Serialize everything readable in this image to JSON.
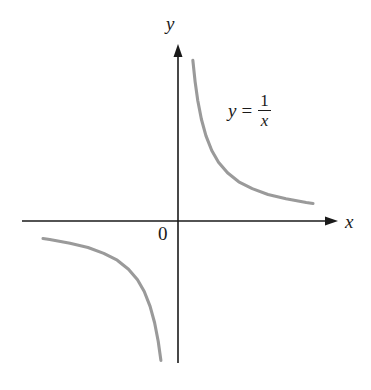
{
  "figure": {
    "background_color": "#ffffff",
    "axis_color": "#1a1a1a",
    "curve_color": "#9a9a9a",
    "origin_label": "0",
    "x_axis_label": "x",
    "y_axis_label": "y"
  },
  "equation": {
    "lhs": "y",
    "relation": "=",
    "numerator": "1",
    "denominator": "x",
    "plain": "y = 1/x"
  },
  "chart_data": {
    "type": "line",
    "title": "",
    "subtitle": "",
    "xlabel": "x",
    "ylabel": "y",
    "annotations": [
      {
        "text": "y = 1/x",
        "x": 1.55,
        "y": 2.45
      },
      {
        "text": "0",
        "x": -0.22,
        "y": -0.28
      }
    ],
    "legend": [],
    "legend_position": "none",
    "grid": false,
    "axis_arrows": true,
    "tick_labels_x": [],
    "tick_labels_y": [],
    "xlim": [
      -3.1,
      3.2
    ],
    "ylim": [
      -2.9,
      3.5
    ],
    "function": "y = 1/x",
    "series": [
      {
        "name": "y = 1/x (x > 0)",
        "color": "#9a9a9a",
        "x": [
          0.33,
          0.38,
          0.44,
          0.52,
          0.62,
          0.75,
          0.9,
          1.1,
          1.35,
          1.65,
          2.0,
          2.4,
          2.85,
          3.0
        ],
        "y": [
          3.03,
          2.63,
          2.27,
          1.92,
          1.61,
          1.33,
          1.11,
          0.91,
          0.74,
          0.61,
          0.5,
          0.42,
          0.35,
          0.33
        ]
      },
      {
        "name": "y = 1/x (x < 0)",
        "color": "#9a9a9a",
        "x": [
          -3.0,
          -2.85,
          -2.4,
          -2.0,
          -1.65,
          -1.35,
          -1.1,
          -0.9,
          -0.75,
          -0.62,
          -0.52,
          -0.44,
          -0.38
        ],
        "y": [
          -0.33,
          -0.35,
          -0.42,
          -0.5,
          -0.61,
          -0.74,
          -0.91,
          -1.11,
          -1.33,
          -1.61,
          -1.92,
          -2.27,
          -2.63
        ]
      }
    ]
  }
}
